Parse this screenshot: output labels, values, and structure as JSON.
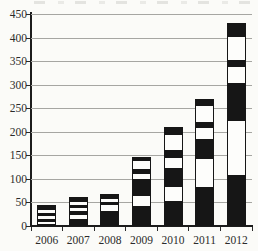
{
  "chart_data": {
    "type": "bar",
    "stacked": true,
    "grid": true,
    "legend": "none",
    "categories": [
      "2006",
      "2007",
      "2008",
      "2009",
      "2010",
      "2011",
      "2012"
    ],
    "ylim": [
      0,
      450
    ],
    "ytick_interval": 50,
    "ytick_labels": [
      "0",
      "50",
      "100",
      "150",
      "200",
      "250",
      "300",
      "350",
      "400",
      "450"
    ],
    "totals": [
      40,
      57,
      64,
      142,
      207,
      267,
      428
    ],
    "palette": {
      "segment_black": "#161616",
      "segment_white": "#fdfdfb",
      "gridline": "#a6a6a2",
      "axis": "#1c1c1c",
      "background": "#fbfbf8"
    },
    "bars": [
      {
        "category": "2006",
        "total": 40,
        "segments": [
          {
            "fill": "black",
            "value": 2
          },
          {
            "fill": "white",
            "value": 5
          },
          {
            "fill": "black",
            "value": 6
          },
          {
            "fill": "white",
            "value": 6
          },
          {
            "fill": "black",
            "value": 6
          },
          {
            "fill": "white",
            "value": 7
          },
          {
            "fill": "black",
            "value": 8
          }
        ]
      },
      {
        "category": "2007",
        "total": 57,
        "segments": [
          {
            "fill": "black",
            "value": 12
          },
          {
            "fill": "white",
            "value": 10
          },
          {
            "fill": "black",
            "value": 7
          },
          {
            "fill": "white",
            "value": 8
          },
          {
            "fill": "black",
            "value": 6
          },
          {
            "fill": "white",
            "value": 7
          },
          {
            "fill": "black",
            "value": 7
          }
        ]
      },
      {
        "category": "2008",
        "total": 64,
        "segments": [
          {
            "fill": "black",
            "value": 30
          },
          {
            "fill": "white",
            "value": 12
          },
          {
            "fill": "black",
            "value": 6
          },
          {
            "fill": "white",
            "value": 7
          },
          {
            "fill": "black",
            "value": 9
          }
        ]
      },
      {
        "category": "2009",
        "total": 142,
        "segments": [
          {
            "fill": "black",
            "value": 40
          },
          {
            "fill": "white",
            "value": 22
          },
          {
            "fill": "black",
            "value": 37
          },
          {
            "fill": "white",
            "value": 10
          },
          {
            "fill": "black",
            "value": 10
          },
          {
            "fill": "white",
            "value": 18
          },
          {
            "fill": "black",
            "value": 5
          }
        ]
      },
      {
        "category": "2010",
        "total": 207,
        "segments": [
          {
            "fill": "black",
            "value": 51
          },
          {
            "fill": "white",
            "value": 31
          },
          {
            "fill": "black",
            "value": 40
          },
          {
            "fill": "white",
            "value": 20
          },
          {
            "fill": "black",
            "value": 17
          },
          {
            "fill": "white",
            "value": 33
          },
          {
            "fill": "black",
            "value": 15
          }
        ]
      },
      {
        "category": "2011",
        "total": 267,
        "segments": [
          {
            "fill": "black",
            "value": 80
          },
          {
            "fill": "white",
            "value": 60
          },
          {
            "fill": "black",
            "value": 43
          },
          {
            "fill": "white",
            "value": 23
          },
          {
            "fill": "black",
            "value": 14
          },
          {
            "fill": "white",
            "value": 34
          },
          {
            "fill": "black",
            "value": 13
          }
        ]
      },
      {
        "category": "2012",
        "total": 428,
        "segments": [
          {
            "fill": "black",
            "value": 107
          },
          {
            "fill": "white",
            "value": 114
          },
          {
            "fill": "black",
            "value": 81
          },
          {
            "fill": "white",
            "value": 34
          },
          {
            "fill": "black",
            "value": 16
          },
          {
            "fill": "white",
            "value": 48
          },
          {
            "fill": "black",
            "value": 28
          }
        ]
      }
    ]
  }
}
